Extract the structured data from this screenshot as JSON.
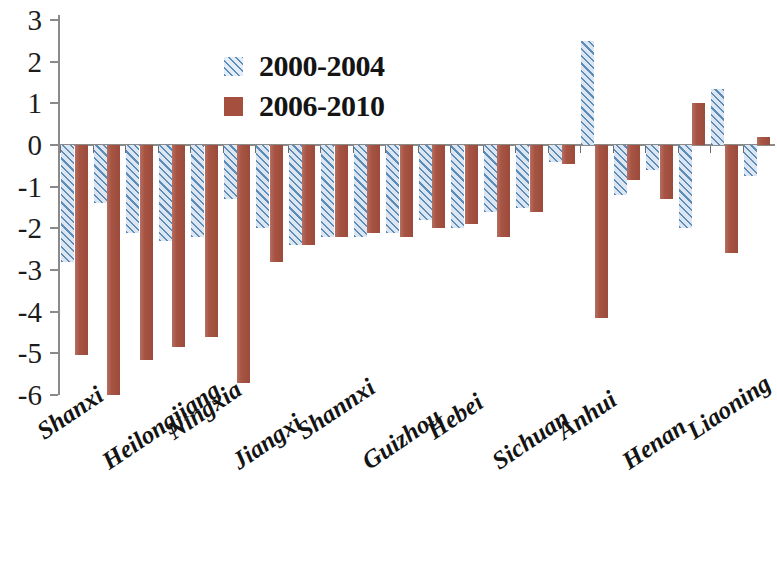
{
  "chart_data": {
    "type": "bar",
    "title": "",
    "xlabel": "",
    "ylabel": "",
    "ylim": [
      -6,
      3
    ],
    "ytick_labels": [
      "3",
      "2",
      "1",
      "0",
      "-1",
      "-2",
      "-3",
      "-4",
      "-5",
      "-6"
    ],
    "ytick_values": [
      3,
      2,
      1,
      0,
      -1,
      -2,
      -3,
      -4,
      -5,
      -6
    ],
    "grid": false,
    "legend_position": "upper-center-left",
    "categories": [
      "Shanxi",
      "",
      "Heilongjiang",
      "",
      "Ningxia",
      "",
      "Jiangxi",
      "",
      "Shannxi",
      "",
      "Guizhou",
      "",
      "Hebei",
      "",
      "Sichuan",
      "",
      "Anhui",
      "",
      "Henan",
      "",
      "Liaoning",
      ""
    ],
    "tick_labels_visible": [
      "Shanxi",
      "Heilongjiang",
      "Ningxia",
      "Jiangxi",
      "Shannxi",
      "Guizhou",
      "Hebei",
      "Sichuan",
      "Anhui",
      "Henan",
      "Liaoning"
    ],
    "series": [
      {
        "name": "2000-2004",
        "color": "#5b8db8",
        "pattern": "diagonal-hatch",
        "values": [
          -2.8,
          -1.4,
          -2.1,
          -2.3,
          -2.2,
          -1.3,
          -2.0,
          -2.4,
          -2.2,
          -2.2,
          -2.1,
          -1.8,
          -2.0,
          -1.6,
          -1.5,
          -0.4,
          2.5,
          -1.2,
          -0.6,
          -2.0,
          1.35,
          -0.75
        ]
      },
      {
        "name": "2006-2010",
        "color": "#a5503f",
        "pattern": "solid",
        "values": [
          -5.05,
          -6.0,
          -5.15,
          -4.85,
          -4.6,
          -5.7,
          -2.8,
          -2.4,
          -2.2,
          -2.1,
          -2.2,
          -2.0,
          -1.9,
          -2.2,
          -1.6,
          -0.45,
          -4.15,
          -0.85,
          -1.3,
          1.0,
          -2.6,
          0.2
        ]
      }
    ]
  },
  "legend": {
    "items": [
      {
        "label": "2000-2004",
        "style": "blue"
      },
      {
        "label": "2006-2010",
        "style": "brown"
      }
    ]
  }
}
